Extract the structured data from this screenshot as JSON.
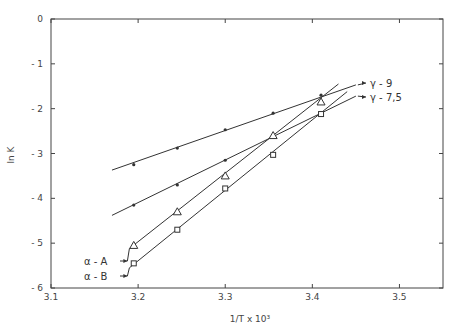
{
  "chart_data": {
    "type": "line",
    "title": "",
    "xlabel": "1/T x 10³",
    "ylabel": "ln K",
    "xlim": [
      3.1,
      3.55
    ],
    "ylim": [
      -6,
      0
    ],
    "x_ticks": [
      "3.1",
      "3.2",
      "3.3",
      "3.4",
      "3.5"
    ],
    "y_ticks": [
      "0",
      "-1",
      "-2",
      "-3",
      "-4",
      "-5",
      "-6"
    ],
    "grid": false,
    "legend_position": "inline labels with arrows",
    "series": [
      {
        "name": "γ-9",
        "marker": "dot",
        "x": [
          3.195,
          3.245,
          3.3,
          3.355,
          3.41
        ],
        "y": [
          -3.25,
          -2.88,
          -2.47,
          -2.1,
          -1.7
        ],
        "fit_line": {
          "x": [
            3.17,
            3.45
          ],
          "y": [
            -3.37,
            -1.47
          ]
        }
      },
      {
        "name": "γ-7,5",
        "marker": "dot",
        "x": [
          3.195,
          3.245,
          3.3,
          3.355,
          3.41
        ],
        "y": [
          -4.15,
          -3.7,
          -3.15,
          -2.6,
          -2.1
        ],
        "fit_line": {
          "x": [
            3.17,
            3.45
          ],
          "y": [
            -4.38,
            -1.72
          ]
        }
      },
      {
        "name": "α-A",
        "marker": "triangle",
        "x": [
          3.195,
          3.245,
          3.3,
          3.355,
          3.41
        ],
        "y": [
          -5.05,
          -4.3,
          -3.5,
          -2.6,
          -1.85
        ],
        "fit_line": {
          "x": [
            3.19,
            3.43
          ],
          "y": [
            -5.12,
            -1.45
          ]
        }
      },
      {
        "name": "α-B",
        "marker": "square",
        "x": [
          3.195,
          3.245,
          3.3,
          3.355,
          3.41
        ],
        "y": [
          -5.45,
          -4.7,
          -3.78,
          -3.03,
          -2.12
        ],
        "fit_line": {
          "x": [
            3.19,
            3.44
          ],
          "y": [
            -5.55,
            -1.62
          ]
        }
      }
    ],
    "annotations": [
      {
        "text": "γ-9",
        "arrow_to_line_end": true
      },
      {
        "text": "γ-7,5",
        "arrow_to_line_end": true
      },
      {
        "text": "α-A",
        "arrow_to_line_start": true
      },
      {
        "text": "α-B",
        "arrow_to_line_start": true
      }
    ]
  }
}
